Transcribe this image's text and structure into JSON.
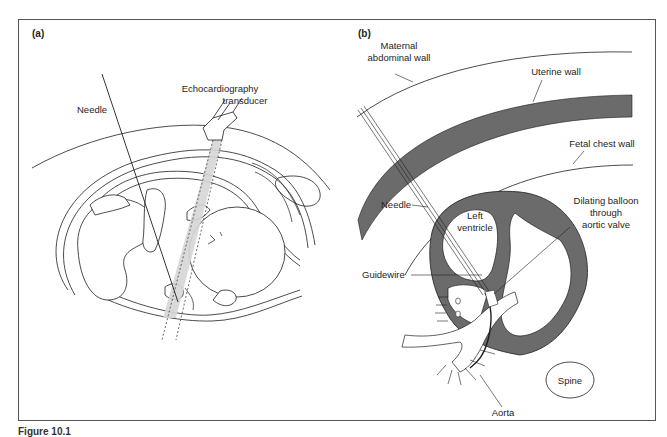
{
  "figure": {
    "colors": {
      "frame": "#555555",
      "line": "#1e1e1e",
      "dark_fill": "#6b6b6b",
      "beam_fill": "#d6d6d6",
      "background": "#ffffff"
    },
    "panel_a": {
      "label": "(a)",
      "annotations": {
        "needle": "Needle",
        "transducer_line1": "Echocardiography",
        "transducer_line2": "transducer"
      }
    },
    "panel_b": {
      "label": "(b)",
      "annotations": {
        "maternal_line1": "Maternal",
        "maternal_line2": "abdominal wall",
        "uterine_wall": "Uterine wall",
        "fetal_chest_wall": "Fetal chest wall",
        "needle": "Needle",
        "left_ventricle_line1": "Left",
        "left_ventricle_line2": "ventricle",
        "balloon_line1": "Dilating balloon",
        "balloon_line2": "through",
        "balloon_line3": "aortic valve",
        "guidewire": "Guidewire",
        "spine": "Spine",
        "aorta": "Aorta"
      }
    },
    "caption": "Figure 10.1"
  }
}
